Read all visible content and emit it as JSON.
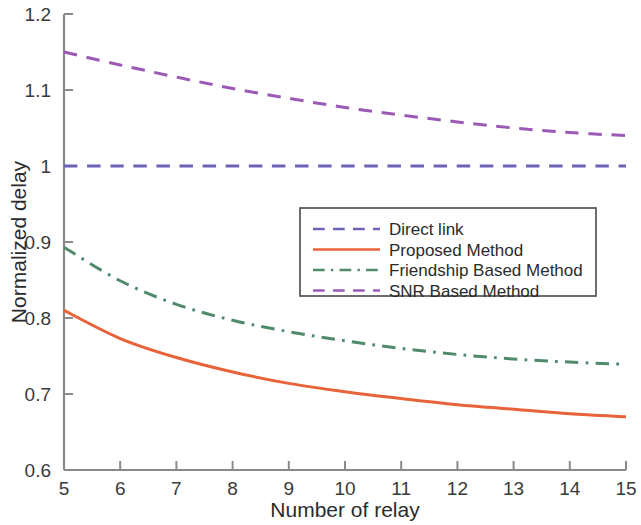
{
  "chart_data": {
    "type": "line",
    "title": "",
    "xlabel": "Number of relay",
    "ylabel": "Normalized delay",
    "xlim": [
      5,
      15
    ],
    "ylim": [
      0.6,
      1.2
    ],
    "grid": false,
    "legend_position": "center-right",
    "x": [
      5,
      6,
      7,
      8,
      9,
      10,
      11,
      12,
      13,
      14,
      15
    ],
    "xticks": [
      "5",
      "6",
      "7",
      "8",
      "9",
      "10",
      "11",
      "12",
      "13",
      "14",
      "15"
    ],
    "yticks": [
      "0.6",
      "0.7",
      "0.8",
      "0.9",
      "1",
      "1.1",
      "1.2"
    ],
    "ytick_values": [
      0.6,
      0.7,
      0.8,
      0.9,
      1.0,
      1.1,
      1.2
    ],
    "series": [
      {
        "name": "Direct link",
        "color": "#6b63b5",
        "style": "dashed",
        "values": [
          1.0,
          1.0,
          1.0,
          1.0,
          1.0,
          1.0,
          1.0,
          1.0,
          1.0,
          1.0,
          1.0
        ]
      },
      {
        "name": "Proposed Method",
        "color": "#e8633a",
        "style": "solid",
        "values": [
          0.81,
          0.773,
          0.748,
          0.729,
          0.714,
          0.703,
          0.694,
          0.686,
          0.68,
          0.674,
          0.67
        ]
      },
      {
        "name": "Friendship Based Method",
        "color": "#4f8a6a",
        "style": "dashdot",
        "values": [
          0.893,
          0.849,
          0.818,
          0.797,
          0.782,
          0.77,
          0.76,
          0.752,
          0.746,
          0.742,
          0.739
        ]
      },
      {
        "name": "SNR Based Method",
        "color": "#9b5ab5",
        "style": "dashed",
        "values": [
          1.15,
          1.133,
          1.117,
          1.102,
          1.089,
          1.077,
          1.067,
          1.058,
          1.05,
          1.044,
          1.04
        ]
      }
    ]
  },
  "legend": {
    "entries": [
      {
        "label": "Direct link"
      },
      {
        "label": "Proposed Method"
      },
      {
        "label": "Friendship Based Method"
      },
      {
        "label": "SNR Based Method"
      }
    ]
  },
  "axes": {
    "x_title": "Number of relay",
    "y_title": "Normalized delay"
  }
}
